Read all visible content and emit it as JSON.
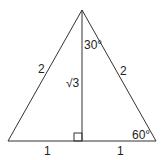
{
  "diagram": {
    "colors": {
      "stroke": "#333333",
      "text": "#222222",
      "background": "#ffffff"
    },
    "vertices": {
      "apex": [
        82,
        10
      ],
      "base_left": [
        8,
        141
      ],
      "base_right": [
        156,
        141
      ],
      "foot": [
        82,
        141
      ]
    },
    "labels": {
      "left_side": "2",
      "right_side": "2",
      "altitude": "√3",
      "top_angle": "30°",
      "bottom_right_angle": "60°",
      "base_left_half": "1",
      "base_right_half": "1"
    },
    "right_angle_marker": {
      "x": 74,
      "y": 133,
      "size": 8
    }
  }
}
